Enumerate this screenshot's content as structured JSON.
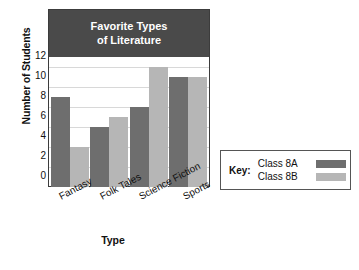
{
  "chart_data": {
    "type": "bar",
    "title": "Favorite Types of Literature",
    "title_lines": [
      "Favorite Types",
      "of Literature"
    ],
    "xlabel": "Type",
    "ylabel": "Number of Students",
    "categories": [
      "Fantasy",
      "Folk Tales",
      "Science Fiction",
      "Sports"
    ],
    "series": [
      {
        "name": "Class 8A",
        "color": "#6e6e6e",
        "values": [
          9,
          6,
          8,
          11
        ]
      },
      {
        "name": "Class 8B",
        "color": "#b6b6b6",
        "values": [
          4,
          7,
          12,
          11
        ]
      }
    ],
    "ylim": [
      0,
      13
    ],
    "yticks": [
      0,
      2,
      4,
      6,
      8,
      10,
      12
    ],
    "ytick_labels": [
      "0",
      "2",
      "4",
      "6",
      "8",
      "10",
      "12"
    ],
    "grid": true,
    "legend_position": "right",
    "title_banner_color": "#4a4a4a",
    "title_text_color": "#ffffff",
    "background_color": "#ffffff"
  },
  "legend": {
    "title": "Key:",
    "entries": [
      {
        "label": "Class 8A",
        "color": "#6e6e6e"
      },
      {
        "label": "Class 8B",
        "color": "#b6b6b6"
      }
    ]
  }
}
